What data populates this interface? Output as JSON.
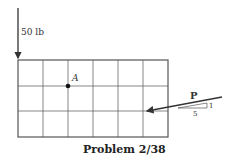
{
  "diagram": {
    "caption": "Problem 2/38",
    "vertical_force_label": "50 lb",
    "point_label": "A",
    "force_label": "P",
    "slope": {
      "rise": "1",
      "run": "5"
    },
    "grid": {
      "columns": 6,
      "rows": 3
    }
  }
}
